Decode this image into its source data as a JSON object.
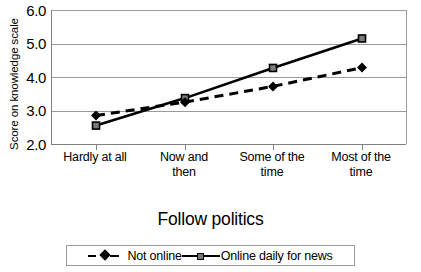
{
  "chart_data": {
    "type": "line",
    "title": "",
    "xlabel": "Follow politics",
    "ylabel": "Score on knowledge scale",
    "categories": [
      "Hardly at all",
      "Now and then",
      "Some of the time",
      "Most of the time"
    ],
    "category_lines": [
      [
        "Hardly at all"
      ],
      [
        "Now and",
        "then"
      ],
      [
        "Some of the",
        "time"
      ],
      [
        "Most of the",
        "time"
      ]
    ],
    "ylim": [
      2.0,
      6.0
    ],
    "yticks": [
      "6.0",
      "5.0",
      "4.0",
      "3.0",
      "2.0"
    ],
    "ytick_values": [
      6.0,
      5.0,
      4.0,
      3.0,
      2.0
    ],
    "grid": "horizontal",
    "legend_position": "bottom",
    "series": [
      {
        "name": "Not online",
        "values": [
          2.85,
          3.25,
          3.72,
          4.28
        ],
        "style": "dashed",
        "marker": "diamond",
        "color": "#000000"
      },
      {
        "name": "Online daily for news",
        "values": [
          2.55,
          3.37,
          4.27,
          5.15
        ],
        "style": "solid",
        "marker": "square",
        "color": "#000000",
        "marker_fill": "#7a7a7a"
      }
    ]
  },
  "legend": {
    "entries": [
      {
        "label": "Not online"
      },
      {
        "label": "Online daily for news"
      }
    ]
  },
  "colors": {
    "axis": "#808080",
    "grid": "#9a9a9a",
    "line": "#000000",
    "square_fill": "#7a7a7a",
    "background": "#ffffff"
  }
}
